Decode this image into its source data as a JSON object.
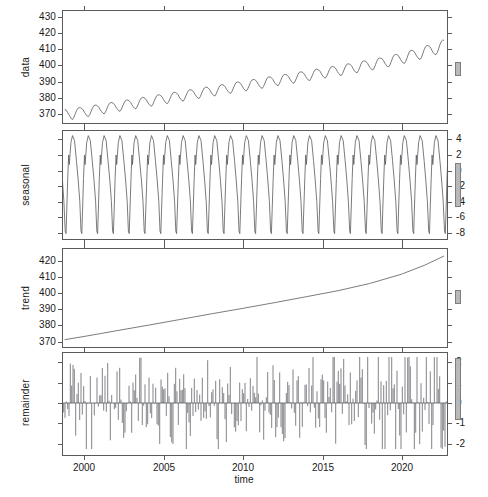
{
  "chart_data": {
    "type": "line",
    "title": "",
    "xlabel": "time",
    "grid": false,
    "legend": null,
    "xlim": [
      1998.6,
      2022.9
    ],
    "xticks": [
      2000,
      2005,
      2010,
      2015,
      2020
    ],
    "xticklabels": [
      "2000",
      "2005",
      "2010",
      "2015",
      "2020"
    ],
    "panels": [
      {
        "name": "data",
        "ylabel": "data",
        "ylim": [
          364,
          434
        ],
        "yticks": [
          370,
          380,
          390,
          400,
          410,
          420,
          430
        ],
        "yticklabels": [
          "370",
          "380",
          "390",
          "400",
          "410",
          "420",
          "430"
        ],
        "label_side": "left",
        "series": [
          {
            "name": "observed",
            "x": [
              1998.71,
              1998.79,
              1998.88,
              1998.96,
              1999.04,
              1999.13,
              1999.21,
              1999.29,
              1999.38,
              1999.46,
              1999.54,
              1999.63,
              1999.71,
              1999.79,
              1999.88,
              1999.96,
              2000.04,
              2000.13,
              2000.21,
              2000.29,
              2000.38,
              2000.46,
              2000.54,
              2000.63,
              2000.71,
              2000.79,
              2000.88,
              2000.96,
              2001.04,
              2001.13,
              2001.21,
              2001.29,
              2001.38,
              2001.46,
              2001.54,
              2001.63,
              2001.71,
              2001.79,
              2001.88,
              2001.96,
              2002.04,
              2002.13,
              2002.21,
              2002.29,
              2002.38,
              2002.46,
              2002.54,
              2002.63,
              2002.71,
              2002.79,
              2002.88,
              2002.96,
              2003.04,
              2003.13,
              2003.21,
              2003.29,
              2003.38,
              2003.46,
              2003.54,
              2003.63,
              2003.71,
              2003.79,
              2003.88,
              2003.96,
              2004.04,
              2004.13,
              2004.21,
              2004.29,
              2004.38,
              2004.46,
              2004.54,
              2004.63,
              2004.71,
              2004.79,
              2004.88,
              2004.96,
              2005.04,
              2005.13,
              2005.21,
              2005.29,
              2005.38,
              2005.46,
              2005.54,
              2005.63,
              2005.71,
              2005.79,
              2005.88,
              2005.96,
              2006.04,
              2006.13,
              2006.21,
              2006.29,
              2006.38,
              2006.46,
              2006.54,
              2006.63,
              2006.71,
              2006.79,
              2006.88,
              2006.96,
              2007.04,
              2007.13,
              2007.21,
              2007.29,
              2007.38,
              2007.46,
              2007.54,
              2007.63,
              2007.71,
              2007.79,
              2007.88,
              2007.96,
              2008.04,
              2008.13,
              2008.21,
              2008.29,
              2008.38,
              2008.46,
              2008.54,
              2008.63,
              2008.71,
              2008.79,
              2008.88,
              2008.96,
              2009.04,
              2009.13,
              2009.21,
              2009.29,
              2009.38,
              2009.46,
              2009.54,
              2009.63,
              2009.71,
              2009.79,
              2009.88,
              2009.96,
              2010.04,
              2010.13,
              2010.21,
              2010.29,
              2010.38,
              2010.46,
              2010.54,
              2010.63,
              2010.71,
              2010.79,
              2010.88,
              2010.96,
              2011.04,
              2011.13,
              2011.21,
              2011.29,
              2011.38,
              2011.46,
              2011.54,
              2011.63,
              2011.71,
              2011.79,
              2011.88,
              2011.96,
              2012.04,
              2012.13,
              2012.21,
              2012.29,
              2012.38,
              2012.46,
              2012.54,
              2012.63,
              2012.71,
              2012.79,
              2012.88,
              2012.96,
              2013.04,
              2013.13,
              2013.21,
              2013.29,
              2013.38,
              2013.46,
              2013.54,
              2013.63,
              2013.71,
              2013.79,
              2013.88,
              2013.96,
              2014.04,
              2014.13,
              2014.21,
              2014.29,
              2014.38,
              2014.46,
              2014.54,
              2014.63,
              2014.71,
              2014.79,
              2014.88,
              2014.96,
              2015.04,
              2015.13,
              2015.21,
              2015.29,
              2015.38,
              2015.46,
              2015.54,
              2015.63,
              2015.71,
              2015.79,
              2015.88,
              2015.96,
              2016.04,
              2016.13,
              2016.21,
              2016.29,
              2016.38,
              2016.46,
              2016.54,
              2016.63,
              2016.71,
              2016.79,
              2016.88,
              2016.96,
              2017.04,
              2017.13,
              2017.21,
              2017.29,
              2017.38,
              2017.46,
              2017.54,
              2017.63,
              2017.71,
              2017.79,
              2017.88,
              2017.96,
              2018.04,
              2018.13,
              2018.21,
              2018.29,
              2018.38,
              2018.46,
              2018.54,
              2018.63,
              2018.71,
              2018.79,
              2018.88,
              2018.96,
              2019.04,
              2019.13,
              2019.21,
              2019.29,
              2019.38,
              2019.46,
              2019.54,
              2019.63,
              2019.71,
              2019.79,
              2019.88,
              2019.96,
              2020.04,
              2020.13,
              2020.21,
              2020.29,
              2020.38,
              2020.46,
              2020.54,
              2020.63,
              2020.71,
              2020.79,
              2020.88,
              2020.96,
              2021.04,
              2021.13,
              2021.21,
              2021.29,
              2021.38,
              2021.46,
              2021.54,
              2021.63,
              2021.71,
              2021.79,
              2021.88,
              2021.96,
              2022.04,
              2022.13,
              2022.21,
              2022.29,
              2022.38,
              2022.46,
              2022.54,
              2022.63,
              2022.71
            ],
            "y": [
              372.4,
              372.1,
              370.8,
              369.4,
              368.1,
              366.6,
              366.2,
              367.6,
              369.8,
              371.8,
              373.2,
              373.6,
              373.5,
              373.1,
              372.1,
              370.6,
              369.4,
              368.4,
              368.0,
              369.2,
              371.3,
              373.2,
              374.7,
              375.2,
              375.1,
              374.7,
              373.6,
              372.2,
              371.1,
              370.1,
              369.7,
              370.9,
              373.0,
              374.9,
              376.3,
              376.8,
              376.7,
              376.3,
              375.2,
              373.8,
              372.6,
              371.6,
              371.3,
              372.5,
              374.6,
              376.5,
              377.9,
              378.4,
              378.3,
              377.9,
              376.9,
              375.4,
              374.2,
              373.2,
              372.9,
              374.1,
              376.2,
              378.1,
              379.5,
              380.0,
              379.9,
              379.5,
              378.4,
              377.0,
              375.8,
              374.8,
              374.5,
              375.7,
              377.8,
              379.7,
              381.1,
              381.6,
              381.5,
              381.1,
              380.1,
              378.6,
              377.4,
              376.4,
              376.1,
              377.3,
              379.4,
              381.3,
              382.7,
              383.2,
              383.1,
              382.7,
              381.7,
              380.2,
              379.0,
              378.0,
              377.7,
              378.9,
              381.0,
              382.9,
              384.3,
              384.8,
              384.7,
              384.3,
              383.2,
              381.8,
              380.6,
              379.6,
              379.3,
              380.5,
              382.6,
              384.5,
              385.9,
              386.4,
              386.3,
              385.9,
              384.9,
              383.4,
              382.2,
              381.2,
              380.9,
              382.1,
              384.2,
              386.1,
              387.5,
              388.0,
              387.9,
              387.5,
              386.4,
              385.0,
              383.8,
              382.8,
              382.5,
              383.7,
              385.8,
              387.7,
              389.1,
              389.6,
              389.5,
              389.1,
              388.0,
              386.6,
              385.4,
              384.4,
              384.1,
              385.3,
              387.4,
              389.3,
              390.7,
              391.2,
              391.1,
              390.7,
              389.6,
              388.2,
              387.0,
              386.0,
              385.7,
              386.9,
              389.0,
              390.9,
              392.3,
              392.8,
              392.7,
              392.3,
              391.2,
              389.8,
              388.6,
              387.6,
              387.3,
              388.5,
              390.6,
              392.5,
              393.9,
              394.4,
              394.3,
              393.9,
              392.8,
              391.4,
              390.2,
              389.2,
              388.9,
              390.1,
              392.2,
              394.1,
              395.5,
              396.0,
              395.9,
              395.5,
              394.4,
              393.0,
              391.8,
              390.8,
              390.5,
              391.7,
              393.8,
              395.7,
              397.1,
              397.6,
              397.5,
              397.1,
              396.1,
              394.6,
              393.4,
              392.4,
              392.1,
              393.3,
              395.4,
              397.3,
              398.8,
              399.3,
              399.2,
              398.8,
              397.7,
              396.2,
              395.0,
              394.0,
              393.7,
              394.9,
              397.1,
              399.0,
              400.5,
              401.0,
              400.9,
              400.5,
              399.4,
              397.9,
              396.7,
              395.7,
              395.4,
              396.6,
              398.8,
              400.8,
              402.3,
              402.8,
              402.7,
              402.3,
              401.1,
              399.7,
              398.5,
              397.5,
              397.2,
              398.4,
              400.6,
              402.6,
              404.1,
              404.6,
              404.5,
              404.1,
              403.0,
              401.5,
              400.3,
              399.3,
              399.1,
              400.3,
              402.6,
              404.7,
              406.3,
              406.9,
              406.8,
              406.4,
              405.2,
              403.7,
              402.5,
              401.5,
              401.3,
              402.6,
              404.9,
              407.1,
              408.8,
              409.4,
              409.3,
              408.9,
              407.7,
              406.2,
              405.0,
              404.0,
              403.8,
              405.2,
              407.6,
              409.9,
              411.7,
              412.4,
              412.3,
              411.9,
              410.6,
              409.1,
              407.9,
              406.9,
              406.8,
              408.2,
              410.7,
              413.1,
              415.0,
              415.8,
              415.7,
              415.3,
              414.0,
              412.5,
              411.3,
              410.3,
              410.2,
              411.7,
              414.3,
              416.8,
              418.8,
              419.6,
              419.5,
              419.1,
              417.8,
              416.3,
              415.1,
              414.1,
              414.0,
              415.5,
              418.2,
              420.8,
              422.9,
              423.7,
              423.6,
              423.2,
              421.8
            ]
          }
        ],
        "scale_bar": true
      },
      {
        "name": "seasonal",
        "ylabel": "seasonal",
        "ylim": [
          -8.9,
          5.2
        ],
        "yticks": [
          4,
          2,
          0,
          -2,
          -4,
          -6,
          -8
        ],
        "yticklabels": [
          "4",
          "2",
          "0",
          "-2",
          "-4",
          "-6",
          "-8"
        ],
        "label_side": "right",
        "series": [
          {
            "name": "seasonal",
            "amplitude_high": 4.6,
            "amplitude_low": -8.2,
            "period_years": 1.0,
            "shape": "sawtooth-spike",
            "cycles": 24
          }
        ],
        "scale_bar": true
      },
      {
        "name": "trend",
        "ylabel": "trend",
        "ylim": [
          366,
          428
        ],
        "yticks": [
          370,
          380,
          390,
          400,
          410,
          420
        ],
        "yticklabels": [
          "370",
          "380",
          "390",
          "400",
          "410",
          "420"
        ],
        "label_side": "left",
        "series": [
          {
            "name": "trend",
            "x": [
              1998.71,
              2000.0,
              2002.0,
              2004.0,
              2006.0,
              2008.0,
              2010.0,
              2012.0,
              2014.0,
              2016.0,
              2018.0,
              2020.0,
              2021.5,
              2022.71
            ],
            "y": [
              370.6,
              372.8,
              376.3,
              379.8,
              383.4,
              387.0,
              390.5,
              394.1,
              397.8,
              401.6,
              406.2,
              412.0,
              417.8,
              423.6
            ]
          }
        ],
        "scale_bar": true
      },
      {
        "name": "remainder",
        "ylabel": "remainder",
        "ylim": [
          -2.6,
          2.5
        ],
        "yticks": [
          2,
          1,
          0,
          -1,
          -2
        ],
        "yticklabels": [
          "2",
          "1",
          "0",
          "-1",
          "-2"
        ],
        "label_side": "right",
        "series": [
          {
            "name": "remainder",
            "plot_style": "spikes-from-zero",
            "range_min": -2.3,
            "range_max": 2.3,
            "n_points": 288
          }
        ],
        "scale_bar": true
      }
    ]
  },
  "axis": {
    "xlabel": "time",
    "xticklabels": [
      "2000",
      "2005",
      "2010",
      "2015",
      "2020"
    ]
  },
  "panel_labels": {
    "data": "data",
    "seasonal": "seasonal",
    "trend": "trend",
    "remainder": "remainder"
  },
  "caption": ""
}
